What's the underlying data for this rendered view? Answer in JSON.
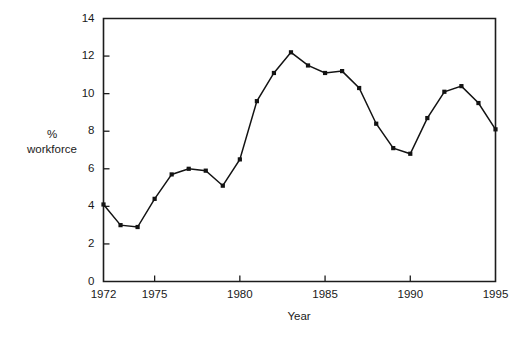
{
  "chart_data": {
    "type": "line",
    "title": "",
    "subtitle": "",
    "xlabel": "Year",
    "ylabel": "% workforce",
    "ylabel_line1": "%",
    "ylabel_line2": "workforce",
    "xlim": [
      1972,
      1995
    ],
    "ylim": [
      0,
      14
    ],
    "grid": false,
    "legend": false,
    "legend_position": "none",
    "marker": "square",
    "line_color": "#131313",
    "marker_color": "#131313",
    "axis_color": "#1c1c1c",
    "background": "#ffffff",
    "y_ticks": [
      0,
      2,
      4,
      6,
      8,
      10,
      12,
      14
    ],
    "y_tick_labels": [
      "0",
      "2",
      "4",
      "6",
      "8",
      "10",
      "12",
      "14"
    ],
    "x_ticks": [
      1972,
      1975,
      1980,
      1985,
      1990,
      1995
    ],
    "x_tick_labels": [
      "1972",
      "1975",
      "1980",
      "1985",
      "1990",
      "1995"
    ],
    "x": [
      1972,
      1973,
      1974,
      1975,
      1976,
      1977,
      1978,
      1979,
      1980,
      1981,
      1982,
      1983,
      1984,
      1985,
      1986,
      1987,
      1988,
      1989,
      1990,
      1991,
      1992,
      1993,
      1994,
      1995
    ],
    "values": [
      4.1,
      3.0,
      2.9,
      4.4,
      5.7,
      6.0,
      5.9,
      5.1,
      6.5,
      9.6,
      11.1,
      12.2,
      11.5,
      11.1,
      11.2,
      10.3,
      8.4,
      7.1,
      6.8,
      8.7,
      10.1,
      10.4,
      9.5,
      8.1
    ],
    "series": [
      {
        "name": "% workforce",
        "x": [
          1972,
          1973,
          1974,
          1975,
          1976,
          1977,
          1978,
          1979,
          1980,
          1981,
          1982,
          1983,
          1984,
          1985,
          1986,
          1987,
          1988,
          1989,
          1990,
          1991,
          1992,
          1993,
          1994,
          1995
        ],
        "values": [
          4.1,
          3.0,
          2.9,
          4.4,
          5.7,
          6.0,
          5.9,
          5.1,
          6.5,
          9.6,
          11.1,
          12.2,
          11.5,
          11.1,
          11.2,
          10.3,
          8.4,
          7.1,
          6.8,
          8.7,
          10.1,
          10.4,
          9.5,
          8.1
        ]
      }
    ]
  }
}
